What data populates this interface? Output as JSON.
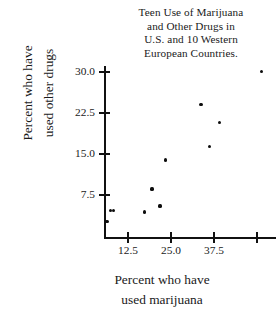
{
  "chart_data": {
    "type": "scatter",
    "title": "Teen Use of Marijuana and Other Drugs in U.S. and 10 Western European Countries.",
    "title_lines": [
      "Teen Use of Marijuana",
      "and Other Drugs in",
      "U.S. and 10 Western",
      "European Countries."
    ],
    "xlabel": "Percent who have used marijuana",
    "xlabel_lines": [
      "Percent who have",
      "used marijuana"
    ],
    "ylabel": "Percent who have used other drugs",
    "ylabel_lines": [
      "Percent who have",
      "used other drugs"
    ],
    "xticks": [
      12.5,
      25.0,
      37.5,
      50.0
    ],
    "xtick_labels": [
      "12.5",
      "25.0",
      "37.5",
      ""
    ],
    "yticks": [
      7.5,
      15.0,
      22.5,
      30.0
    ],
    "ytick_labels": [
      "7.5",
      "15.0",
      "22.5",
      "30.0"
    ],
    "xlim": [
      5.5,
      55.5
    ],
    "ylim": [
      0.0,
      31.5
    ],
    "grid": false,
    "legend": false,
    "marker": "dot",
    "marker_color": "#0d0d0d",
    "axis_color": "#111111",
    "background": "#ffffff",
    "points": [
      {
        "x": 6.4,
        "y": 2.7
      },
      {
        "x": 7.3,
        "y": 4.6
      },
      {
        "x": 8.4,
        "y": 4.6
      },
      {
        "x": 17.4,
        "y": 4.4
      },
      {
        "x": 21.8,
        "y": 5.5
      },
      {
        "x": 19.5,
        "y": 8.6
      },
      {
        "x": 23.3,
        "y": 13.9
      },
      {
        "x": 36.3,
        "y": 16.4
      },
      {
        "x": 39.2,
        "y": 20.8
      },
      {
        "x": 33.7,
        "y": 24.0
      },
      {
        "x": 51.2,
        "y": 30.1
      }
    ]
  }
}
